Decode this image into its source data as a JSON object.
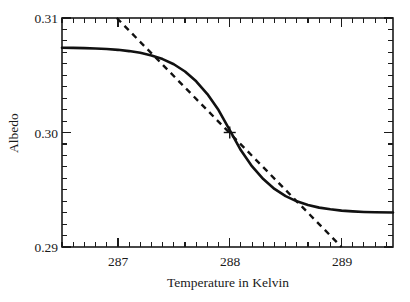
{
  "chart_data": {
    "type": "line",
    "title": "",
    "subtitle": "",
    "xlabel": "Temperature in Kelvin",
    "ylabel": "Albedo",
    "xlim": [
      286.5,
      289.46
    ],
    "ylim": [
      0.29,
      0.31
    ],
    "grid": false,
    "legend": null,
    "legend_position": "none",
    "x_ticks_major": [
      287,
      288,
      289
    ],
    "x_tick_labels": [
      "287",
      "288",
      "289"
    ],
    "x_minor_tick_step": 0.1,
    "y_ticks_major": [
      0.29,
      0.3,
      0.31
    ],
    "y_tick_labels": [
      "0.29",
      "0.30",
      "0.31"
    ],
    "y_minor_tick_step": 0.001,
    "tick_direction": "in",
    "series": [
      {
        "name": "albedo-sigmoid",
        "style": "solid",
        "color": "#111111",
        "description": "Smooth sigmoid albedo transition",
        "x": [
          286.5,
          286.6,
          286.7,
          286.8,
          286.9,
          287.0,
          287.1,
          287.2,
          287.3,
          287.4,
          287.5,
          287.6,
          287.7,
          287.8,
          287.9,
          288.0,
          288.1,
          288.2,
          288.3,
          288.4,
          288.5,
          288.6,
          288.7,
          288.8,
          288.9,
          289.0,
          289.1,
          289.2,
          289.3,
          289.46
        ],
        "y": [
          0.3074,
          0.30739,
          0.30737,
          0.30734,
          0.30729,
          0.30722,
          0.30711,
          0.30696,
          0.30673,
          0.30641,
          0.30596,
          0.30533,
          0.30447,
          0.30336,
          0.30196,
          0.3002,
          0.29844,
          0.29704,
          0.29593,
          0.29507,
          0.29444,
          0.29399,
          0.29367,
          0.29344,
          0.29329,
          0.29318,
          0.29311,
          0.29306,
          0.29303,
          0.29301
        ]
      },
      {
        "name": "tangent-line",
        "style": "dashed",
        "color": "#111111",
        "description": "Tangent at inflection point",
        "x": [
          286.99,
          289.0
        ],
        "y": [
          0.31,
          0.29
        ]
      }
    ],
    "annotations": [
      {
        "name": "inflection-marker",
        "marker": "plus",
        "x": 288.0,
        "y": 0.3,
        "label": ""
      }
    ]
  },
  "axes": {
    "x_title": "Temperature in Kelvin",
    "y_title": "Albedo",
    "x_labels": [
      "287",
      "288",
      "289"
    ],
    "y_labels": [
      "0.29",
      "0.30",
      "0.31"
    ]
  },
  "colors": {
    "foreground": "#1a1a1a",
    "curve": "#111111",
    "background": "#ffffff"
  }
}
